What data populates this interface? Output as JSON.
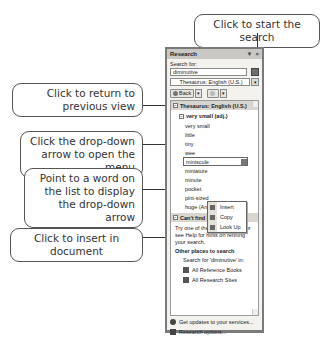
{
  "callouts": {
    "start_search": "Click to start the search",
    "return_previous": "Click to return to previous view",
    "dropdown_menu": "Click the drop-down arrow to open the menu",
    "point_word": "Point to a word on the list to display the drop-down arrow",
    "insert_doc": "Click to insert in document"
  },
  "pane": {
    "title": "Research",
    "title_controls": [
      "▼",
      "×"
    ],
    "search_label": "Search for:",
    "search_value": "diminutive",
    "source_select": "Thesaurus: English (U.S.)",
    "back_label": "Back",
    "results": {
      "section_title": "Thesaurus: English (U.S.)",
      "group_title": "very small (adj.)",
      "words": [
        "very small",
        "little",
        "tiny",
        "wee",
        "miniscule",
        "miniature",
        "minute",
        "pocket",
        "pint-sized",
        "huge (Antonym)"
      ],
      "hover_word_index": 4,
      "menu": [
        "Insert",
        "Copy",
        "Look Up"
      ],
      "cant_find_title": "Can't find it?",
      "cant_find_text": "Try one of these alternatives or see Help for hints on refining your search.",
      "other_places_title": "Other places to search",
      "search_for_text": "Search for 'diminutive' in:",
      "links": [
        "All Reference Books",
        "All Research Sites"
      ]
    },
    "footer": {
      "updates": "Get updates to your services...",
      "options": "Research options..."
    }
  }
}
